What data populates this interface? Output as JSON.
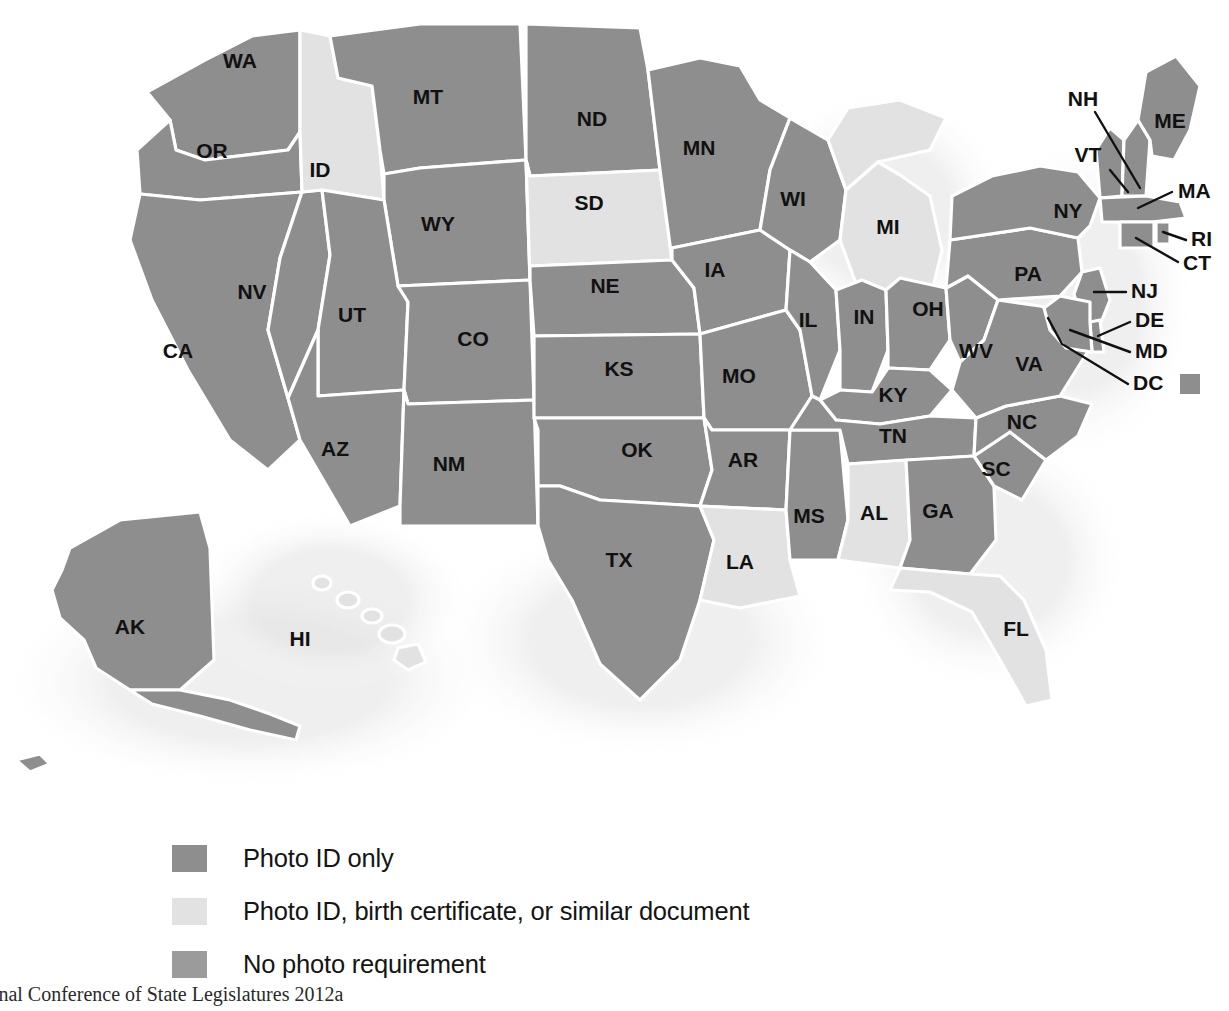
{
  "figure": {
    "kind": "choropleth-map",
    "region": "United States",
    "caption": "National Conference of State Legislatures 2012a"
  },
  "colors": {
    "photo_id_only": "#8e8e8e",
    "photo_id_or_document": "#e2e2e2",
    "no_photo_requirement": "#9b9b9b",
    "border": "#ffffff",
    "label": "#111111",
    "background": "#ffffff",
    "halo": "#dedede"
  },
  "legend": {
    "items": [
      {
        "label": "Photo ID only",
        "color": "#8e8e8e",
        "key": "photo_id_only"
      },
      {
        "label": "Photo ID, birth certificate, or similar document",
        "color": "#e2e2e2",
        "key": "photo_id_or_document"
      },
      {
        "label": "No photo requirement",
        "color": "#9b9b9b",
        "key": "no_photo_requirement"
      }
    ]
  },
  "map": {
    "inset_labels": [
      "AK",
      "HI"
    ],
    "leader_labels": [
      "NH",
      "VT",
      "MA",
      "RI",
      "CT",
      "NJ",
      "DE",
      "MD",
      "DC"
    ],
    "dc_swatch_color": "#8e8e8e",
    "states": [
      {
        "abbr": "WA",
        "category": "photo_id_only"
      },
      {
        "abbr": "OR",
        "category": "photo_id_only"
      },
      {
        "abbr": "CA",
        "category": "photo_id_only"
      },
      {
        "abbr": "NV",
        "category": "photo_id_only"
      },
      {
        "abbr": "ID",
        "category": "photo_id_or_document"
      },
      {
        "abbr": "MT",
        "category": "photo_id_only"
      },
      {
        "abbr": "WY",
        "category": "photo_id_only"
      },
      {
        "abbr": "UT",
        "category": "photo_id_only"
      },
      {
        "abbr": "AZ",
        "category": "photo_id_only"
      },
      {
        "abbr": "CO",
        "category": "photo_id_only"
      },
      {
        "abbr": "NM",
        "category": "photo_id_only"
      },
      {
        "abbr": "ND",
        "category": "photo_id_only"
      },
      {
        "abbr": "SD",
        "category": "photo_id_or_document"
      },
      {
        "abbr": "NE",
        "category": "photo_id_only"
      },
      {
        "abbr": "KS",
        "category": "photo_id_only"
      },
      {
        "abbr": "OK",
        "category": "photo_id_only"
      },
      {
        "abbr": "TX",
        "category": "photo_id_only"
      },
      {
        "abbr": "MN",
        "category": "photo_id_only"
      },
      {
        "abbr": "IA",
        "category": "photo_id_only"
      },
      {
        "abbr": "MO",
        "category": "photo_id_only"
      },
      {
        "abbr": "AR",
        "category": "photo_id_only"
      },
      {
        "abbr": "LA",
        "category": "photo_id_or_document"
      },
      {
        "abbr": "WI",
        "category": "photo_id_only"
      },
      {
        "abbr": "IL",
        "category": "photo_id_only"
      },
      {
        "abbr": "MS",
        "category": "photo_id_only"
      },
      {
        "abbr": "MI",
        "category": "photo_id_or_document"
      },
      {
        "abbr": "IN",
        "category": "photo_id_only"
      },
      {
        "abbr": "KY",
        "category": "photo_id_only"
      },
      {
        "abbr": "TN",
        "category": "photo_id_only"
      },
      {
        "abbr": "AL",
        "category": "photo_id_or_document"
      },
      {
        "abbr": "OH",
        "category": "photo_id_only"
      },
      {
        "abbr": "WV",
        "category": "photo_id_only"
      },
      {
        "abbr": "GA",
        "category": "photo_id_only"
      },
      {
        "abbr": "FL",
        "category": "photo_id_or_document"
      },
      {
        "abbr": "SC",
        "category": "photo_id_only"
      },
      {
        "abbr": "NC",
        "category": "photo_id_only"
      },
      {
        "abbr": "VA",
        "category": "photo_id_only"
      },
      {
        "abbr": "PA",
        "category": "photo_id_only"
      },
      {
        "abbr": "NY",
        "category": "photo_id_only"
      },
      {
        "abbr": "VT",
        "category": "photo_id_only"
      },
      {
        "abbr": "NH",
        "category": "photo_id_only"
      },
      {
        "abbr": "ME",
        "category": "photo_id_only"
      },
      {
        "abbr": "MA",
        "category": "photo_id_only"
      },
      {
        "abbr": "RI",
        "category": "photo_id_only"
      },
      {
        "abbr": "CT",
        "category": "photo_id_only"
      },
      {
        "abbr": "NJ",
        "category": "photo_id_only"
      },
      {
        "abbr": "DE",
        "category": "photo_id_only"
      },
      {
        "abbr": "MD",
        "category": "photo_id_only"
      },
      {
        "abbr": "DC",
        "category": "photo_id_only"
      },
      {
        "abbr": "AK",
        "category": "photo_id_only"
      },
      {
        "abbr": "HI",
        "category": "photo_id_or_document"
      }
    ]
  }
}
